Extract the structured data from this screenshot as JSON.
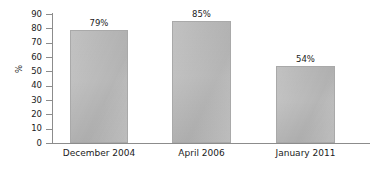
{
  "chart_data": {
    "type": "bar",
    "title": "",
    "xlabel": "",
    "ylabel": "%",
    "categories": [
      "December 2004",
      "April 2006",
      "January 2011"
    ],
    "values": [
      79,
      85,
      54
    ],
    "value_labels": [
      "79%",
      "85%",
      "54%"
    ],
    "ylim": [
      0,
      90
    ],
    "ytick_step": 10,
    "ytick_labels": [
      "90",
      "80",
      "70",
      "60",
      "50",
      "40",
      "30",
      "20",
      "10",
      "0"
    ],
    "ytick_values": [
      90,
      80,
      70,
      60,
      50,
      40,
      30,
      20,
      10,
      0
    ],
    "grid": false,
    "legend": false,
    "legend_position": "none",
    "bar_color": "#b9b9b9",
    "axis_color": "#8c8c8c",
    "text_color": "#1b1b1b",
    "background_color": "#ffffff"
  }
}
